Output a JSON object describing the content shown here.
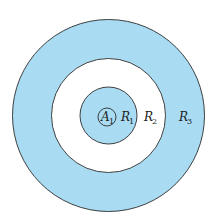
{
  "diagram": {
    "colors": {
      "fill_blue": "#a9dcf2",
      "fill_white": "#ffffff",
      "stroke": "#2c2c2c"
    },
    "regions": [
      {
        "id": "A1",
        "letter": "A",
        "sub": "1",
        "fill": "blue"
      },
      {
        "id": "R1",
        "letter": "R",
        "sub": "1",
        "fill": "blue"
      },
      {
        "id": "R2",
        "letter": "R",
        "sub": "2",
        "fill": "white"
      },
      {
        "id": "R3",
        "letter": "R",
        "sub": "3",
        "fill": "blue"
      }
    ]
  }
}
